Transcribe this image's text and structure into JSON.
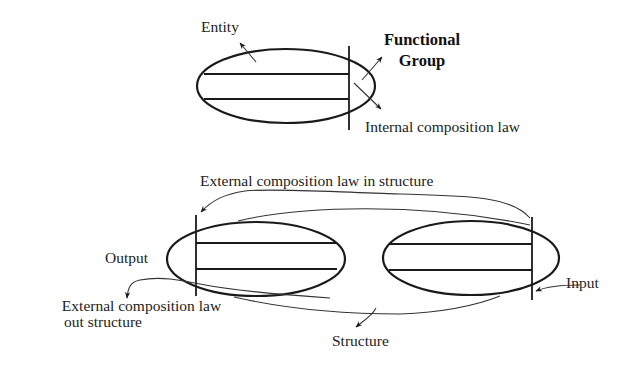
{
  "diagram": {
    "top": {
      "entity_label": "Entity",
      "functional_group_label_line1": "Functional",
      "functional_group_label_line2": "Group",
      "internal_law_label": "Internal composition law"
    },
    "bottom": {
      "external_in_label": "External composition law in structure",
      "output_label": "Output",
      "input_label": "Input",
      "external_out_label_line1": "External composition law",
      "external_out_label_line2": "out structure",
      "structure_label": "Structure"
    },
    "colors": {
      "stroke": "#1a1a1a",
      "text": "#222222",
      "background": "#ffffff"
    }
  }
}
